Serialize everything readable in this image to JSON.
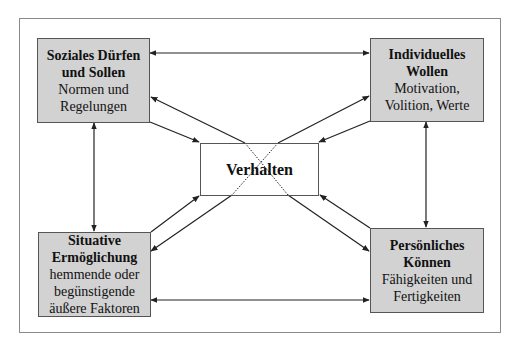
{
  "diagram": {
    "nodes": {
      "top_left": {
        "title_lines": [
          "Soziales Dürfen",
          "und Sollen"
        ],
        "sub_lines": [
          "Normen und",
          "Regelungen"
        ]
      },
      "top_right": {
        "title_lines": [
          "Individuelles",
          "Wollen"
        ],
        "sub_lines": [
          "Motivation,",
          "Volition, Werte"
        ]
      },
      "center": {
        "title_lines": [
          "Verhalten"
        ],
        "sub_lines": []
      },
      "bottom_left": {
        "title_lines": [
          "Situative",
          "Ermöglichung"
        ],
        "sub_lines": [
          "hemmende oder",
          "begünstigende",
          "äußere Faktoren"
        ]
      },
      "bottom_right": {
        "title_lines": [
          "Persönliches",
          "Können"
        ],
        "sub_lines": [
          "Fähigkeiten und",
          "Fertigkeiten"
        ]
      }
    },
    "edges": [
      {
        "from": "top_left",
        "to": "top_right",
        "bidirectional": true
      },
      {
        "from": "top_left",
        "to": "bottom_left",
        "bidirectional": true
      },
      {
        "from": "top_right",
        "to": "bottom_right",
        "bidirectional": true
      },
      {
        "from": "bottom_left",
        "to": "bottom_right",
        "bidirectional": true
      },
      {
        "from": "top_left",
        "to": "center",
        "bidirectional": true
      },
      {
        "from": "top_right",
        "to": "center",
        "bidirectional": true
      },
      {
        "from": "bottom_left",
        "to": "center",
        "bidirectional": true
      },
      {
        "from": "bottom_right",
        "to": "center",
        "bidirectional": true
      },
      {
        "from": "top_left",
        "to": "bottom_right",
        "bidirectional": true,
        "style": "diagonal-through-center"
      },
      {
        "from": "top_right",
        "to": "bottom_left",
        "bidirectional": true,
        "style": "diagonal-through-center"
      }
    ],
    "colors": {
      "box_fill": "#d2d2d2",
      "box_border": "#555555",
      "line": "#222222",
      "frame": "#8a8a8a"
    }
  }
}
